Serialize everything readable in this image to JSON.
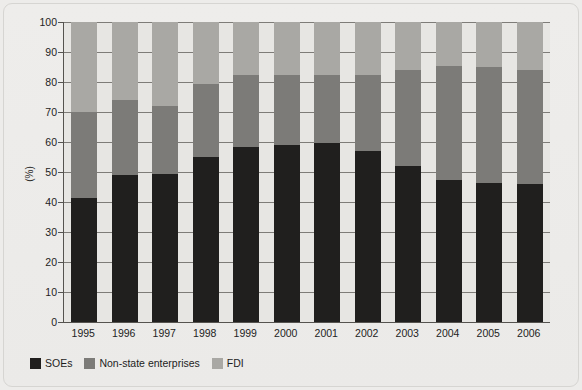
{
  "chart_data": {
    "type": "bar",
    "subtype": "stacked-bar-100-percent",
    "title": "",
    "subtitle": "",
    "xlabel": "",
    "ylabel": "(%)",
    "ylim": [
      0,
      100
    ],
    "ytick_labels": [
      "0",
      "10",
      "20",
      "30",
      "40",
      "50",
      "60",
      "70",
      "80",
      "90",
      "100"
    ],
    "ytick_values": [
      0,
      10,
      20,
      30,
      40,
      50,
      60,
      70,
      80,
      90,
      100
    ],
    "grid": true,
    "grid_axis": "y",
    "legend_position": "bottom-left",
    "categories": [
      "1995",
      "1996",
      "1997",
      "1998",
      "1999",
      "2000",
      "2001",
      "2002",
      "2003",
      "2004",
      "2005",
      "2006"
    ],
    "series": [
      {
        "name": "SOEs",
        "color": "#201f1e",
        "values": [
          41.5,
          49.0,
          49.5,
          55.0,
          58.5,
          59.0,
          59.7,
          57.0,
          52.0,
          47.5,
          46.5,
          46.0
        ]
      },
      {
        "name": "Non-state enterprises",
        "color": "#7c7b78",
        "values": [
          28.5,
          25.0,
          22.5,
          24.5,
          24.0,
          23.5,
          22.8,
          25.5,
          32.0,
          38.0,
          38.5,
          38.0
        ]
      },
      {
        "name": "FDI",
        "color": "#a9a8a4",
        "values": [
          30.0,
          26.0,
          28.0,
          20.5,
          17.5,
          17.5,
          17.5,
          17.5,
          16.0,
          14.5,
          15.0,
          16.0
        ]
      }
    ],
    "cumulative_tops": {
      "soe_top": [
        41.5,
        49.0,
        49.5,
        55.0,
        58.5,
        59.0,
        59.7,
        57.0,
        52.0,
        47.5,
        46.5,
        46.0
      ],
      "nonstate_top": [
        70.0,
        74.0,
        72.0,
        79.5,
        82.5,
        82.5,
        82.5,
        82.5,
        84.0,
        85.5,
        85.0,
        84.0
      ],
      "fdi_top": [
        100,
        100,
        100,
        100,
        100,
        100,
        100,
        100,
        100,
        100,
        100,
        100
      ]
    }
  },
  "legend": {
    "items": [
      {
        "label": "SOEs",
        "color": "#201f1e"
      },
      {
        "label": "Non-state enterprises",
        "color": "#7c7b78"
      },
      {
        "label": "FDI",
        "color": "#a9a8a4"
      }
    ]
  },
  "axes": {
    "y_title": "(%)"
  },
  "colors": {
    "background": "#edecea",
    "plot_background": "#e7e6e3",
    "axis_line": "#55534f",
    "gridline": "#7e7c78",
    "text": "#232323"
  }
}
